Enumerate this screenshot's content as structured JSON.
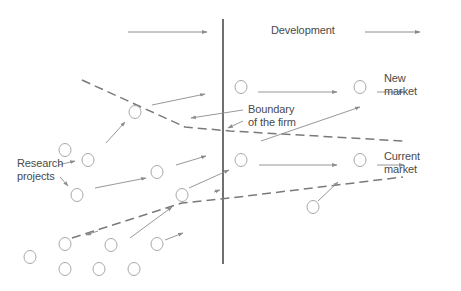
{
  "diagram": {
    "title_label": "Development",
    "labels": {
      "development": "Development",
      "new_market_line1": "New",
      "new_market_line2": "market",
      "current_market_line1": "Current",
      "current_market_line2": "market",
      "research_line1": "Research",
      "research_line2": "projects",
      "boundary_line1": "Boundary",
      "boundary_line2": "of the firm"
    },
    "colors": {
      "arrow": "#8c8c8c",
      "circle": "#a8a8a8",
      "dashed_boundary": "#7a7a7a",
      "firm_line": "#333333",
      "text": "#4a4a4a"
    },
    "nodes": [
      {
        "id": "n1",
        "x": 135,
        "y": 112
      },
      {
        "id": "n2",
        "x": 65,
        "y": 150
      },
      {
        "id": "n3",
        "x": 88,
        "y": 160
      },
      {
        "id": "n4",
        "x": 77,
        "y": 195
      },
      {
        "id": "n5",
        "x": 157,
        "y": 172
      },
      {
        "id": "n6",
        "x": 182,
        "y": 195
      },
      {
        "id": "n7",
        "x": 241,
        "y": 87
      },
      {
        "id": "n8",
        "x": 360,
        "y": 87
      },
      {
        "id": "n9",
        "x": 241,
        "y": 160
      },
      {
        "id": "n10",
        "x": 360,
        "y": 160
      },
      {
        "id": "n11",
        "x": 313,
        "y": 207
      },
      {
        "id": "n12",
        "x": 65,
        "y": 244
      },
      {
        "id": "n13",
        "x": 111,
        "y": 245
      },
      {
        "id": "n14",
        "x": 157,
        "y": 244
      },
      {
        "id": "n15",
        "x": 30,
        "y": 257
      },
      {
        "id": "n16",
        "x": 65,
        "y": 269
      },
      {
        "id": "n17",
        "x": 99,
        "y": 269
      },
      {
        "id": "n18",
        "x": 134,
        "y": 269
      }
    ]
  }
}
